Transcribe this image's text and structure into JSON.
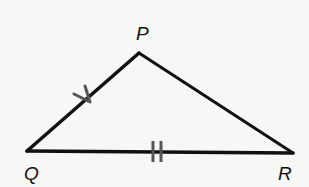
{
  "diagram": {
    "type": "triangle",
    "colors": {
      "background": "#f7f7f5",
      "stroke": "#111111",
      "tick": "#555555"
    },
    "vertices": [
      {
        "name": "P",
        "x": 139,
        "y": 53,
        "label_x": 136,
        "label_y": 40
      },
      {
        "name": "Q",
        "x": 27,
        "y": 151,
        "label_x": 24,
        "label_y": 180
      },
      {
        "name": "R",
        "x": 293,
        "y": 153,
        "label_x": 278,
        "label_y": 180
      }
    ],
    "sides": [
      {
        "name": "PQ",
        "from": "P",
        "to": "Q",
        "tick_marks": 1,
        "tick_style": "check"
      },
      {
        "name": "PR",
        "from": "P",
        "to": "R",
        "tick_marks": 0
      },
      {
        "name": "QR",
        "from": "Q",
        "to": "R",
        "tick_marks": 2,
        "tick_style": "double-bar"
      }
    ],
    "labels": {
      "P": "P",
      "Q": "Q",
      "R": "R"
    }
  }
}
